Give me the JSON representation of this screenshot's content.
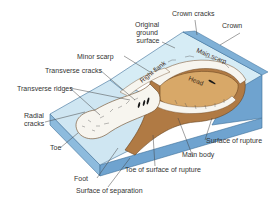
{
  "figure": {
    "colors": {
      "plateau_top": "#d6ecf5",
      "slope_surface": "#cfe6f2",
      "block_side_right": "#6fa3cf",
      "block_side_front": "#8dbbdd",
      "block_edge": "#3d6f99",
      "rupture_surface_brown": "#b07a44",
      "head_tan": "#d8a868",
      "debris_white": "#f7f5ef",
      "label_text": "#333333"
    },
    "labels": {
      "original_ground_surface": [
        "Original",
        "ground",
        "surface"
      ],
      "crown_cracks": "Crown cracks",
      "crown": "Crown",
      "minor_scarp": "Minor scarp",
      "main_scarp": "Main scarp",
      "transverse_cracks": "Transverse cracks",
      "right_flank": "Right flank",
      "head": "Head",
      "transverse_ridges": "Transverse ridges",
      "radial_cracks": [
        "Radial",
        "cracks"
      ],
      "toe": "Toe",
      "foot": "Foot",
      "surface_of_separation": "Surface of separation",
      "toe_of_surface_of_rupture": "Toe of surface of rupture",
      "main_body": "Main body",
      "surface_of_rupture": "Surface of rupture"
    }
  }
}
